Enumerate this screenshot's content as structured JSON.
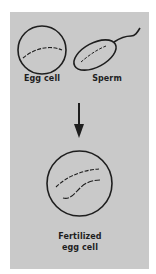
{
  "diagram": {
    "colors": {
      "background": "#ffffff",
      "panel": "#c9c9c9",
      "ink": "#1e1e1e"
    },
    "nodes": [
      {
        "id": "egg-cell",
        "label": "Egg cell",
        "shape": "circle"
      },
      {
        "id": "sperm",
        "label": "Sperm",
        "shape": "ellipse-with-tail"
      },
      {
        "id": "fertilized-egg-cell",
        "label_line1": "Fertilized",
        "label_line2": "egg cell",
        "shape": "circle"
      }
    ],
    "edges": [
      {
        "from": [
          "egg-cell",
          "sperm"
        ],
        "to": "fertilized-egg-cell",
        "type": "down-arrow"
      }
    ]
  }
}
